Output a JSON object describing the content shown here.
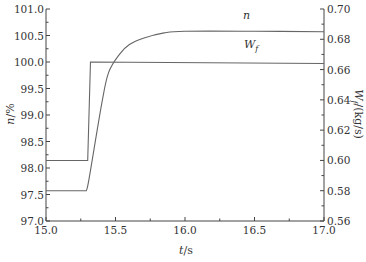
{
  "chart_data": {
    "type": "line",
    "title": "",
    "xlabel": "t/s",
    "ylabel_left": "n/%",
    "ylabel_right": "W_f/(kg/s)",
    "xlim": [
      15.0,
      17.0
    ],
    "ylim_left": [
      97.0,
      101.0
    ],
    "ylim_right": [
      0.56,
      0.7
    ],
    "grid": false,
    "legend": "inline labels",
    "x_ticks": [
      "15.0",
      "15.5",
      "16.0",
      "16.5",
      "17.0"
    ],
    "y_left_ticks": [
      "97.0",
      "97.5",
      "98.0",
      "98.5",
      "99.0",
      "99.5",
      "100.0",
      "100.5",
      "101.0"
    ],
    "y_right_ticks": [
      "0.56",
      "0.58",
      "0.60",
      "0.62",
      "0.64",
      "0.66",
      "0.68",
      "0.70"
    ],
    "series": [
      {
        "name": "n",
        "axis": "left",
        "label": "n",
        "x": [
          15.0,
          15.29,
          15.31,
          15.4,
          15.45,
          15.53,
          15.6,
          15.7,
          15.85,
          16.0,
          16.5,
          17.0
        ],
        "values": [
          97.57,
          97.57,
          97.8,
          99.2,
          99.8,
          100.15,
          100.33,
          100.45,
          100.55,
          100.58,
          100.58,
          100.57
        ]
      },
      {
        "name": "W_f",
        "axis": "right",
        "label": "W_f",
        "x": [
          15.0,
          15.3,
          15.32,
          17.0
        ],
        "values": [
          0.6,
          0.6,
          0.665,
          0.664
        ]
      }
    ]
  },
  "labels": {
    "x_axis_title_italic": "t",
    "x_axis_title_unit": "/s",
    "y_left_title_italic": "n",
    "y_left_title_unit": "/%",
    "y_right_title_italic": "W",
    "y_right_title_sub": "f",
    "y_right_title_unit": "/(kg/s)",
    "series_n": "n",
    "series_wf": "W",
    "series_wf_sub": "f"
  }
}
